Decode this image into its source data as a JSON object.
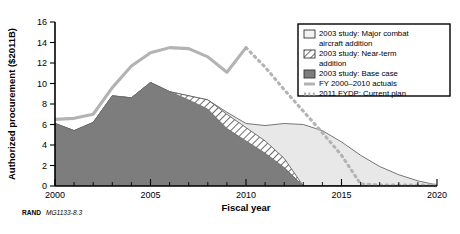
{
  "figure": {
    "source_note_prefix": "RAND",
    "source_note_id": "MG1133-8.3"
  },
  "colors": {
    "base_case_fill": "#7d7d7d",
    "near_term_fill": "#ffffff",
    "near_term_hatch": "#3a3a3a",
    "major_combat_fill": "#e8e8e8",
    "actuals_line": "#b3b3b3",
    "fydp_line": "#b3b3b3",
    "axis": "#000000",
    "legend_border": "#000000",
    "plot_background": "#ffffff"
  },
  "chart_data": {
    "type": "area",
    "title": "",
    "subtitle": "",
    "xlabel": "Fiscal year",
    "ylabel": "Authorized procurement ($2011B)",
    "xlim": [
      2000,
      2020
    ],
    "ylim": [
      0,
      16
    ],
    "xticks": [
      2000,
      2005,
      2010,
      2015,
      2020
    ],
    "xtick_labels": [
      "2000",
      "2005",
      "2010",
      "2015",
      "2020"
    ],
    "xminor_step": 1,
    "yticks": [
      0,
      2,
      4,
      6,
      8,
      10,
      12,
      14,
      16
    ],
    "ytick_labels": [
      "0",
      "2",
      "4",
      "6",
      "8",
      "10",
      "12",
      "14",
      "16"
    ],
    "grid": false,
    "legend_position": "top-right",
    "x": [
      2000,
      2001,
      2002,
      2003,
      2004,
      2005,
      2006,
      2007,
      2008,
      2009,
      2010,
      2011,
      2012,
      2013,
      2014,
      2015,
      2016,
      2017,
      2018,
      2019,
      2020
    ],
    "series": [
      {
        "name": "2003 study: Base case",
        "type": "area",
        "style": "solid-fill",
        "values": [
          6.1,
          5.4,
          6.2,
          8.8,
          8.6,
          10.1,
          9.2,
          8.4,
          7.5,
          5.6,
          4.4,
          3.2,
          1.8,
          0.0,
          0.0,
          0.0,
          0.0,
          0.0,
          0.0,
          0.0,
          0.0
        ]
      },
      {
        "name": "2003 study: Near-term addition",
        "type": "area",
        "style": "hatched",
        "stacked_top_values": [
          6.1,
          5.4,
          6.2,
          8.8,
          8.6,
          10.1,
          9.2,
          8.8,
          8.4,
          7.0,
          5.7,
          4.4,
          2.7,
          0.0,
          0.0,
          0.0,
          0.0,
          0.0,
          0.0,
          0.0,
          0.0
        ]
      },
      {
        "name": "2003 study: Major combat aircraft addition",
        "type": "area",
        "style": "light-fill",
        "stacked_top_values": [
          6.1,
          5.4,
          6.2,
          8.8,
          8.6,
          10.1,
          9.2,
          8.8,
          8.4,
          7.2,
          6.1,
          5.9,
          6.1,
          6.0,
          5.4,
          4.3,
          3.0,
          1.9,
          1.1,
          0.5,
          0.1
        ]
      },
      {
        "name": "FY 2000–2010 actuals",
        "type": "line",
        "style": "solid",
        "x": [
          2000,
          2001,
          2002,
          2003,
          2004,
          2005,
          2006,
          2007,
          2008,
          2009,
          2010
        ],
        "values": [
          6.5,
          6.6,
          7.0,
          9.6,
          11.7,
          13.0,
          13.5,
          13.4,
          12.6,
          11.1,
          13.5
        ]
      },
      {
        "name": "2011 FYDP: Current plan",
        "type": "line",
        "style": "dashed",
        "x": [
          2010,
          2011,
          2012,
          2013,
          2014,
          2015,
          2016,
          2017,
          2018,
          2019,
          2020
        ],
        "values": [
          13.5,
          11.6,
          9.4,
          7.3,
          5.2,
          3.0,
          0.2,
          0.1,
          0.1,
          0.1,
          0.1
        ]
      }
    ],
    "legend": [
      {
        "label_line1": "2003 study: Major combat",
        "label_line2": "aircraft addition",
        "swatch": "light-fill"
      },
      {
        "label_line1": "2003 study: Near-term",
        "label_line2": "addition",
        "swatch": "hatched"
      },
      {
        "label_line1": "2003 study: Base case",
        "label_line2": "",
        "swatch": "solid-fill"
      },
      {
        "label_line1": "FY 2000–2010 actuals",
        "label_line2": "",
        "swatch": "solid-line"
      },
      {
        "label_line1": "2011 FYDP: Current plan",
        "label_line2": "",
        "swatch": "dashed-line"
      }
    ]
  }
}
